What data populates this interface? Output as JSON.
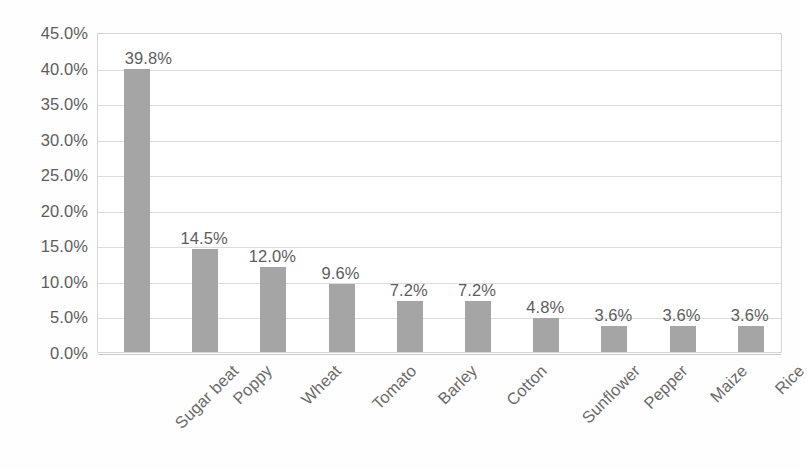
{
  "chart_data": {
    "type": "bar",
    "title": "",
    "subtitle": "",
    "xlabel": "",
    "ylabel": "",
    "categories": [
      "Sugar beat",
      "Poppy",
      "Wheat",
      "Tomato",
      "Barley",
      "Cotton",
      "Sunflower",
      "Pepper",
      "Maize",
      "Rice"
    ],
    "values": [
      39.8,
      14.5,
      12.0,
      9.6,
      7.2,
      7.2,
      4.8,
      3.6,
      3.6,
      3.6
    ],
    "data_labels": [
      "39.8%",
      "14.5%",
      "12.0%",
      "9.6%",
      "7.2%",
      "7.2%",
      "4.8%",
      "3.6%",
      "3.6%",
      "3.6%"
    ],
    "ylim": [
      0,
      45
    ],
    "ytick_values": [
      0,
      5,
      10,
      15,
      20,
      25,
      30,
      35,
      40,
      45
    ],
    "ytick_labels": [
      "0.0%",
      "5.0%",
      "10.0%",
      "15.0%",
      "20.0%",
      "25.0%",
      "30.0%",
      "35.0%",
      "40.0%",
      "45.0%"
    ],
    "grid": "horizontal",
    "legend": "none",
    "series_color": "#a5a5a5",
    "gridline_color": "#dcdcdc",
    "axis_text_color": "#5d5d5d",
    "plot_border_color": "#d6d6d6",
    "background_color": "#ffffff",
    "xtick_rotation_degrees": -45
  }
}
